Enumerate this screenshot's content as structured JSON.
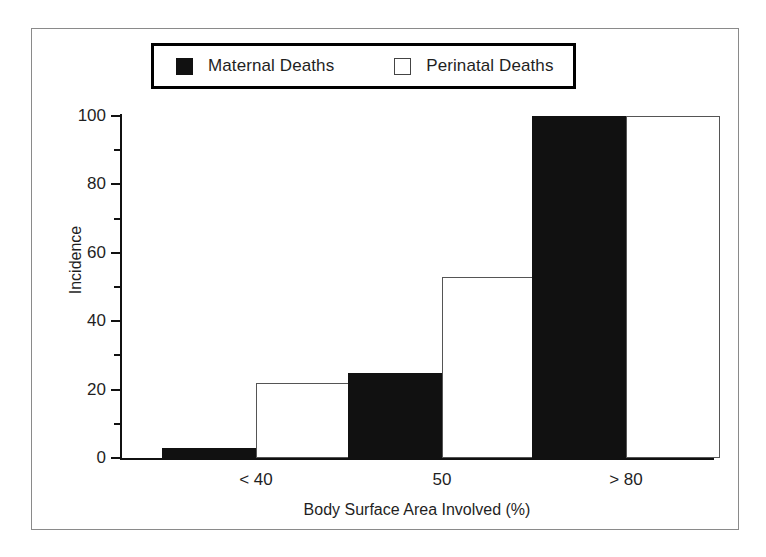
{
  "chart_data": {
    "type": "bar",
    "title": "",
    "subtitle": "",
    "xlabel": "Body Surface Area Involved (%)",
    "ylabel": "Incidence",
    "categories": [
      "< 40",
      "50",
      "> 80"
    ],
    "series": [
      {
        "name": "Maternal Deaths",
        "values": [
          3,
          25,
          100
        ],
        "fill": "#111111",
        "style": "filled"
      },
      {
        "name": "Perinatal Deaths",
        "values": [
          22,
          53,
          100
        ],
        "fill": "#ffffff",
        "style": "hollow"
      }
    ],
    "ylim": [
      0,
      100
    ],
    "xlim_note": "categorical, 3 groups of 2 adjacent bars",
    "y_major_ticks": [
      0,
      20,
      40,
      60,
      80,
      100
    ],
    "y_minor_ticks": [
      10,
      30,
      50,
      70,
      90
    ],
    "y_tick_labels": [
      "0",
      "20",
      "40",
      "60",
      "80",
      "100"
    ],
    "grid": false,
    "legend_position": "top-center",
    "frame": "outer rectangle border around entire figure",
    "colors": {
      "maternal_fill": "#111111",
      "perinatal_fill": "#ffffff",
      "perinatal_edge": "#555555",
      "axis": "#111111",
      "frame_border": "#8a8a8a",
      "legend_border": "#000000",
      "text": "#1f1f1f"
    }
  },
  "legend": {
    "entries": [
      {
        "label": "Maternal Deaths",
        "swatch": "filled-square-icon"
      },
      {
        "label": "Perinatal Deaths",
        "swatch": "hollow-square-icon"
      }
    ]
  },
  "axes": {
    "y_title": "Incidence",
    "x_title": "Body Surface Area Involved (%)",
    "y_labels": [
      "100",
      "80",
      "60",
      "40",
      "20",
      "0"
    ],
    "x_labels": [
      "< 40",
      "50",
      "> 80"
    ]
  }
}
